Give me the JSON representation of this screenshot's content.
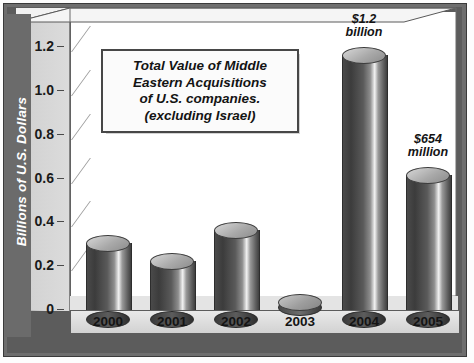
{
  "chart_data": {
    "type": "bar",
    "title": "",
    "subtitle": "",
    "xlabel": "",
    "ylabel": "Billions of U.S. Dollars",
    "categories": [
      "2000",
      "2001",
      "2002",
      "2003",
      "2004",
      "2005"
    ],
    "values": [
      0.34,
      0.26,
      0.4,
      0.03,
      1.2,
      0.654
    ],
    "ylim": [
      0,
      1.3
    ],
    "yticks": [
      "0",
      "0.2",
      "0.4",
      "0.6",
      "0.8",
      "1.0",
      "1.2"
    ],
    "ytick_values": [
      0,
      0.2,
      0.4,
      0.6,
      0.8,
      1.0,
      1.2
    ],
    "grid": false,
    "legend": "none",
    "style": "3d-cylinder",
    "data_labels": [
      {
        "category": "2004",
        "text": "$1.2\nbillion"
      },
      {
        "category": "2005",
        "text": "$654\nmillion"
      }
    ],
    "annotations": [
      {
        "name": "callout",
        "text": "Total Value of Middle\nEastern Acquisitions\nof U.S. companies.\n(excluding Israel)"
      }
    ],
    "colors": {
      "bar_dark": "#3c3c3c",
      "bar_highlight": "#f2f2f2",
      "cap": "#a9a9a9",
      "frame": "#6e6e6e",
      "ylabel_band": "#6b6b6b",
      "text": "#141414",
      "plot_background": "#ffffff"
    }
  }
}
